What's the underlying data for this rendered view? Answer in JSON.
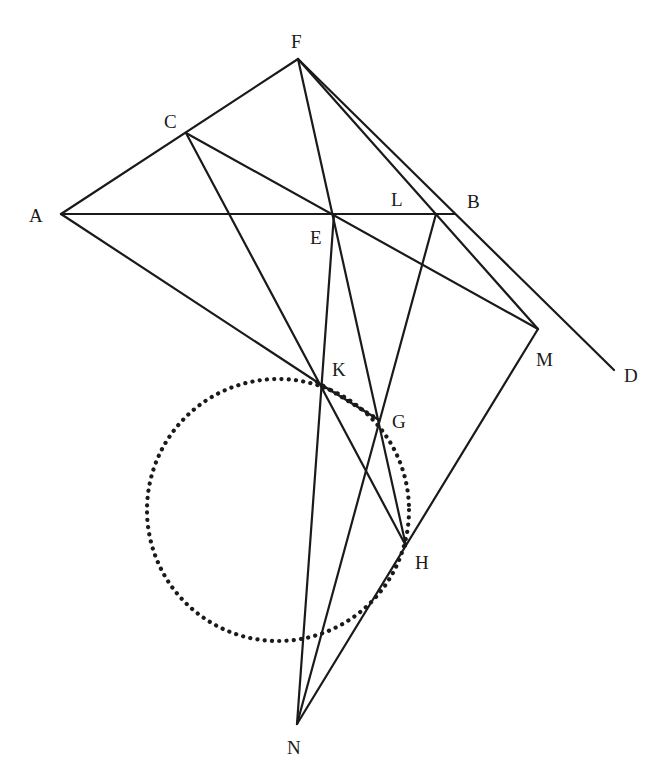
{
  "figure": {
    "type": "geometric-construction",
    "points": {
      "A": {
        "x": 61,
        "y": 214,
        "label": "A",
        "lx": 29,
        "ly": 222
      },
      "C": {
        "x": 186,
        "y": 133,
        "label": "C",
        "lx": 164,
        "ly": 128
      },
      "F": {
        "x": 298,
        "y": 59,
        "label": "F",
        "lx": 291,
        "ly": 48
      },
      "E": {
        "x": 334,
        "y": 214,
        "label": "E",
        "lx": 310,
        "ly": 244
      },
      "L": {
        "x": 436,
        "y": 214,
        "label": "L",
        "lx": 391,
        "ly": 206
      },
      "B": {
        "x": 455,
        "y": 214,
        "label": "B",
        "lx": 467,
        "ly": 208
      },
      "M": {
        "x": 538,
        "y": 329,
        "label": "M",
        "lx": 536,
        "ly": 366
      },
      "D": {
        "x": 614,
        "y": 370,
        "label": "D",
        "lx": 624,
        "ly": 382
      },
      "K": {
        "x": 317,
        "y": 382,
        "label": "K",
        "lx": 332,
        "ly": 376
      },
      "G": {
        "x": 379,
        "y": 420,
        "label": "G",
        "lx": 392,
        "ly": 428
      },
      "H": {
        "x": 406,
        "y": 546,
        "label": "H",
        "lx": 415,
        "ly": 569
      },
      "N": {
        "x": 297,
        "y": 724,
        "label": "N",
        "lx": 287,
        "ly": 754
      }
    },
    "segments": [
      [
        "A",
        "F"
      ],
      [
        "A",
        "B"
      ],
      [
        "F",
        "H"
      ],
      [
        "F",
        "D"
      ],
      [
        "F",
        "M"
      ],
      [
        "C",
        "M"
      ],
      [
        "C",
        "H"
      ],
      [
        "A",
        "K"
      ],
      [
        "E",
        "N"
      ],
      [
        "L",
        "N"
      ],
      [
        "M",
        "N"
      ],
      [
        "K",
        "G"
      ]
    ],
    "dotted_circle": {
      "cx": 278,
      "cy": 510,
      "r": 131
    },
    "dotted_chord": [
      "K",
      "G"
    ]
  }
}
